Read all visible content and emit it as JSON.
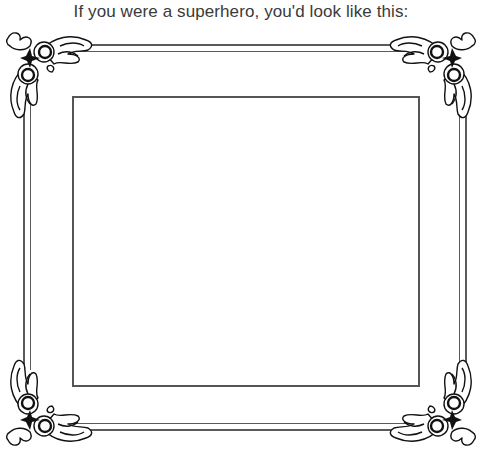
{
  "caption": "If you were a superhero, you'd look like this:",
  "frame": {
    "line_color": "#5a5a5a",
    "photo_area": {
      "label": "",
      "border_color": "#555555"
    }
  },
  "ornaments": {
    "top_left": "corner-ornament-icon",
    "top_right": "corner-ornament-icon",
    "bottom_left": "corner-ornament-icon",
    "bottom_right": "corner-ornament-icon"
  }
}
